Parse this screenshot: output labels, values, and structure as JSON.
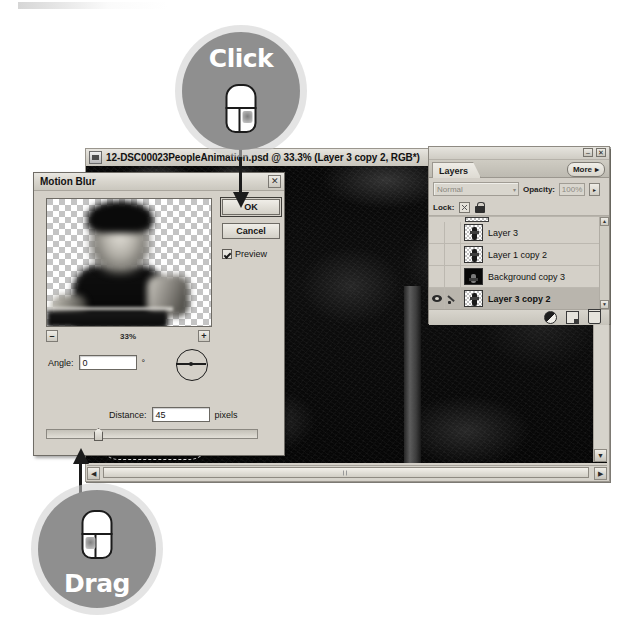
{
  "document_window": {
    "title": "12-DSC00023PeopleAnimation.psd @ 33.3% (Layer 3 copy 2, RGB*)",
    "doc_icon": "photoshop-document-icon",
    "scroll_left_icon": "◀",
    "scroll_right_icon": "▶",
    "scroll_up_icon": "▲",
    "scroll_down_icon": "▼"
  },
  "layers_palette": {
    "tab_label": "Layers",
    "more_label": "More",
    "more_arrow": "▸",
    "minimize_icon": "–",
    "close_icon": "✕",
    "blend_mode": "Normal",
    "blend_caret": "▾",
    "opacity_label": "Opacity:",
    "opacity_value": "100%",
    "opacity_arrow": "▸",
    "lock_label": "Lock:",
    "lock_transparency_icon": "transparency-lock-icon",
    "lock_all_icon": "lock-icon",
    "layers": [
      {
        "name": "Layer 3",
        "visible": false,
        "selected": false,
        "thumb": "checker"
      },
      {
        "name": "Layer 1 copy 2",
        "visible": false,
        "selected": false,
        "thumb": "checker"
      },
      {
        "name": "Background copy 3",
        "visible": false,
        "selected": false,
        "thumb": "dark"
      },
      {
        "name": "Layer 3 copy 2",
        "visible": true,
        "selected": true,
        "thumb": "checker"
      }
    ],
    "bottom_icons": [
      "adjustment-layer-icon",
      "new-layer-icon",
      "delete-layer-icon"
    ]
  },
  "motion_blur_dialog": {
    "title": "Motion Blur",
    "close_icon": "✕",
    "ok_label": "OK",
    "cancel_label": "Cancel",
    "preview_label": "Preview",
    "preview_checked": true,
    "zoom_value": "33%",
    "zoom_out_label": "–",
    "zoom_in_label": "+",
    "angle_label": "Angle:",
    "angle_value": "0",
    "angle_unit": "°",
    "distance_label": "Distance:",
    "distance_value": "45",
    "distance_unit": "pixels"
  },
  "callouts": [
    {
      "id": "click",
      "label": "Click",
      "mouse_button": "right"
    },
    {
      "id": "drag",
      "label": "Drag",
      "mouse_button": "left"
    }
  ],
  "colors": {
    "callout_circle": "#8f8f8f",
    "callout_halo": "#cdcdcd",
    "callout_text": "#ffffff",
    "chrome": "#d4d0c8",
    "leader_line": "#1b1b1b"
  }
}
